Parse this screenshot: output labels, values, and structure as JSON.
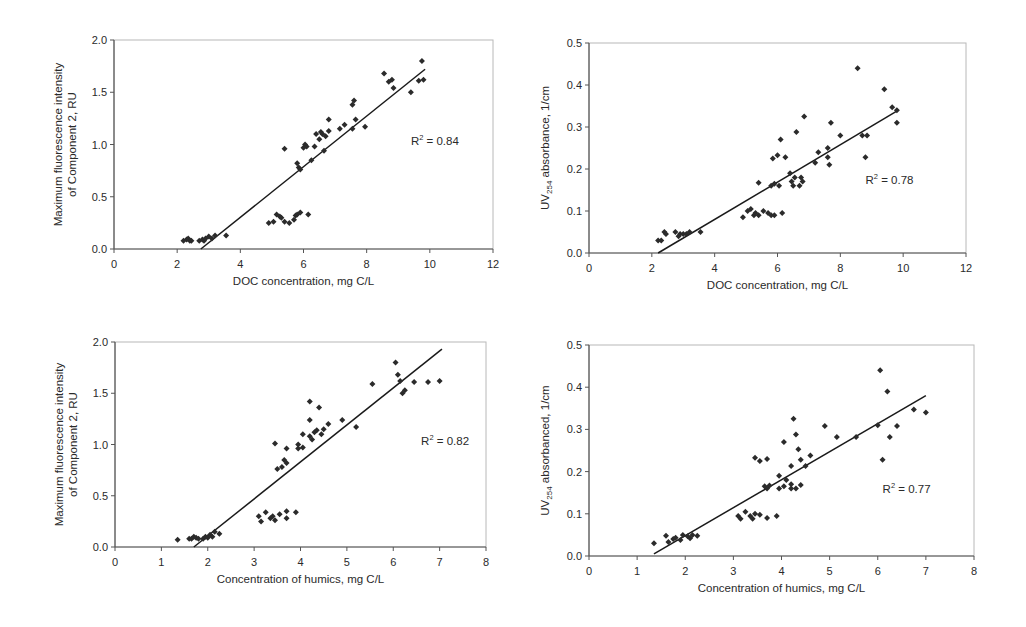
{
  "chart_data": [
    {
      "id": "c1",
      "type": "scatter",
      "title": "",
      "xlabel": "DOC concentration, mg C/L",
      "ylabel_lines": [
        "Maximum fluorescence intensity",
        "of Component 2, RU"
      ],
      "xlim": [
        0,
        12
      ],
      "ylim": [
        0,
        2.0
      ],
      "xticks": [
        0,
        2,
        4,
        6,
        8,
        10,
        12
      ],
      "yticks": [
        0.0,
        0.5,
        1.0,
        1.5,
        2.0
      ],
      "ytick_labels": [
        "0.0",
        "0.5",
        "1.0",
        "1.5",
        "2.0"
      ],
      "grid": false,
      "r2_label": "R",
      "r2_sup": "2",
      "r2_value": " = 0.84",
      "r2_pos": [
        9.4,
        1.0
      ],
      "trendline": {
        "x": [
          2.75,
          9.85
        ],
        "y": [
          0.0,
          1.72
        ]
      },
      "points": [
        [
          2.2,
          0.08
        ],
        [
          2.3,
          0.09
        ],
        [
          2.35,
          0.1
        ],
        [
          2.4,
          0.08
        ],
        [
          2.45,
          0.08
        ],
        [
          2.7,
          0.08
        ],
        [
          2.8,
          0.09
        ],
        [
          2.85,
          0.08
        ],
        [
          2.9,
          0.1
        ],
        [
          3.0,
          0.12
        ],
        [
          3.1,
          0.1
        ],
        [
          3.2,
          0.13
        ],
        [
          3.55,
          0.13
        ],
        [
          4.9,
          0.25
        ],
        [
          5.05,
          0.26
        ],
        [
          5.15,
          0.33
        ],
        [
          5.25,
          0.31
        ],
        [
          5.3,
          0.3
        ],
        [
          5.4,
          0.26
        ],
        [
          5.55,
          0.25
        ],
        [
          5.7,
          0.28
        ],
        [
          5.75,
          0.32
        ],
        [
          5.8,
          0.33
        ],
        [
          5.9,
          0.35
        ],
        [
          6.15,
          0.33
        ],
        [
          5.4,
          0.96
        ],
        [
          5.8,
          0.82
        ],
        [
          5.85,
          0.78
        ],
        [
          5.9,
          0.76
        ],
        [
          6.0,
          0.97
        ],
        [
          6.05,
          1.0
        ],
        [
          6.1,
          0.98
        ],
        [
          6.25,
          0.85
        ],
        [
          6.35,
          0.98
        ],
        [
          6.4,
          1.1
        ],
        [
          6.5,
          1.05
        ],
        [
          6.55,
          1.12
        ],
        [
          6.6,
          1.1
        ],
        [
          6.65,
          0.94
        ],
        [
          6.7,
          1.08
        ],
        [
          6.8,
          1.13
        ],
        [
          6.8,
          1.24
        ],
        [
          7.15,
          1.15
        ],
        [
          7.3,
          1.19
        ],
        [
          7.55,
          1.15
        ],
        [
          7.55,
          1.38
        ],
        [
          7.6,
          1.42
        ],
        [
          7.65,
          1.24
        ],
        [
          7.95,
          1.17
        ],
        [
          8.55,
          1.68
        ],
        [
          8.7,
          1.6
        ],
        [
          8.8,
          1.62
        ],
        [
          8.85,
          1.54
        ],
        [
          9.4,
          1.5
        ],
        [
          9.65,
          1.61
        ],
        [
          9.75,
          1.8
        ],
        [
          9.8,
          1.62
        ]
      ]
    },
    {
      "id": "c2",
      "type": "scatter",
      "title": "",
      "xlabel": "DOC concentration, mg C/L",
      "ylabel_prefix": "UV",
      "ylabel_sub": "254",
      "ylabel_suffix": " absorbance, 1/cm",
      "xlim": [
        0,
        12
      ],
      "ylim": [
        0,
        0.5
      ],
      "xticks": [
        0,
        2,
        4,
        6,
        8,
        10,
        12
      ],
      "yticks": [
        0.0,
        0.1,
        0.2,
        0.3,
        0.4,
        0.5
      ],
      "ytick_labels": [
        "0.0",
        "0.1",
        "0.2",
        "0.3",
        "0.4",
        "0.5"
      ],
      "grid": false,
      "r2_label": "R",
      "r2_sup": "2",
      "r2_value": " = 0.78",
      "r2_pos": [
        8.8,
        0.165
      ],
      "trendline": {
        "x": [
          2.2,
          9.85
        ],
        "y": [
          0.0,
          0.34
        ]
      },
      "points": [
        [
          2.2,
          0.03
        ],
        [
          2.3,
          0.03
        ],
        [
          2.4,
          0.05
        ],
        [
          2.45,
          0.045
        ],
        [
          2.75,
          0.05
        ],
        [
          2.85,
          0.04
        ],
        [
          2.9,
          0.045
        ],
        [
          3.0,
          0.045
        ],
        [
          3.1,
          0.045
        ],
        [
          3.2,
          0.05
        ],
        [
          3.55,
          0.05
        ],
        [
          4.9,
          0.085
        ],
        [
          5.05,
          0.1
        ],
        [
          5.15,
          0.105
        ],
        [
          5.25,
          0.09
        ],
        [
          5.3,
          0.095
        ],
        [
          5.4,
          0.09
        ],
        [
          5.55,
          0.1
        ],
        [
          5.7,
          0.095
        ],
        [
          5.8,
          0.09
        ],
        [
          5.9,
          0.09
        ],
        [
          6.15,
          0.095
        ],
        [
          5.4,
          0.167
        ],
        [
          5.8,
          0.16
        ],
        [
          5.85,
          0.225
        ],
        [
          5.9,
          0.165
        ],
        [
          6.0,
          0.233
        ],
        [
          6.05,
          0.16
        ],
        [
          6.1,
          0.27
        ],
        [
          6.25,
          0.228
        ],
        [
          6.4,
          0.19
        ],
        [
          6.45,
          0.17
        ],
        [
          6.5,
          0.16
        ],
        [
          6.55,
          0.18
        ],
        [
          6.6,
          0.288
        ],
        [
          6.7,
          0.16
        ],
        [
          6.75,
          0.18
        ],
        [
          6.8,
          0.17
        ],
        [
          6.85,
          0.325
        ],
        [
          7.2,
          0.215
        ],
        [
          7.3,
          0.24
        ],
        [
          7.6,
          0.25
        ],
        [
          7.6,
          0.228
        ],
        [
          7.65,
          0.21
        ],
        [
          7.7,
          0.31
        ],
        [
          8.0,
          0.28
        ],
        [
          8.55,
          0.44
        ],
        [
          8.7,
          0.28
        ],
        [
          8.8,
          0.228
        ],
        [
          8.85,
          0.28
        ],
        [
          9.4,
          0.39
        ],
        [
          9.65,
          0.347
        ],
        [
          9.8,
          0.31
        ],
        [
          9.8,
          0.34
        ]
      ]
    },
    {
      "id": "c3",
      "type": "scatter",
      "title": "",
      "xlabel": "Concentration of humics, mg C/L",
      "ylabel_lines": [
        "Maximum fluorescence intensity",
        "of Component 2, RU"
      ],
      "xlim": [
        0,
        8
      ],
      "ylim": [
        0,
        2.0
      ],
      "xticks": [
        0,
        1,
        2,
        3,
        4,
        5,
        6,
        7,
        8
      ],
      "yticks": [
        0.0,
        0.5,
        1.0,
        1.5,
        2.0
      ],
      "ytick_labels": [
        "0.0",
        "0.5",
        "1.0",
        "1.5",
        "2.0"
      ],
      "grid": false,
      "r2_label": "R",
      "r2_sup": "2",
      "r2_value": " = 0.82",
      "r2_pos": [
        6.6,
        1.0
      ],
      "trendline": {
        "x": [
          1.7,
          7.05
        ],
        "y": [
          0.0,
          1.93
        ]
      },
      "points": [
        [
          1.35,
          0.07
        ],
        [
          1.6,
          0.08
        ],
        [
          1.65,
          0.08
        ],
        [
          1.7,
          0.1
        ],
        [
          1.75,
          0.09
        ],
        [
          1.8,
          0.08
        ],
        [
          1.9,
          0.08
        ],
        [
          1.95,
          0.1
        ],
        [
          2.0,
          0.09
        ],
        [
          2.05,
          0.12
        ],
        [
          2.1,
          0.1
        ],
        [
          2.15,
          0.15
        ],
        [
          2.25,
          0.13
        ],
        [
          3.1,
          0.3
        ],
        [
          3.15,
          0.25
        ],
        [
          3.25,
          0.34
        ],
        [
          3.35,
          0.28
        ],
        [
          3.4,
          0.3
        ],
        [
          3.45,
          0.26
        ],
        [
          3.55,
          0.32
        ],
        [
          3.7,
          0.35
        ],
        [
          3.7,
          0.28
        ],
        [
          3.9,
          0.34
        ],
        [
          3.45,
          1.01
        ],
        [
          3.5,
          0.76
        ],
        [
          3.6,
          0.78
        ],
        [
          3.65,
          0.85
        ],
        [
          3.7,
          0.82
        ],
        [
          3.7,
          0.96
        ],
        [
          3.95,
          0.96
        ],
        [
          3.95,
          1.0
        ],
        [
          4.05,
          0.97
        ],
        [
          4.05,
          1.1
        ],
        [
          4.2,
          1.08
        ],
        [
          4.2,
          1.42
        ],
        [
          4.2,
          1.24
        ],
        [
          4.25,
          1.05
        ],
        [
          4.3,
          1.12
        ],
        [
          4.35,
          1.14
        ],
        [
          4.4,
          1.36
        ],
        [
          4.45,
          1.1
        ],
        [
          4.5,
          1.15
        ],
        [
          4.6,
          1.2
        ],
        [
          4.9,
          1.24
        ],
        [
          5.2,
          1.17
        ],
        [
          5.55,
          1.59
        ],
        [
          6.05,
          1.8
        ],
        [
          6.1,
          1.68
        ],
        [
          6.15,
          1.62
        ],
        [
          6.2,
          1.5
        ],
        [
          6.25,
          1.53
        ],
        [
          6.45,
          1.61
        ],
        [
          6.75,
          1.61
        ],
        [
          7.0,
          1.62
        ]
      ]
    },
    {
      "id": "c4",
      "type": "scatter",
      "title": "",
      "xlabel": "Concentration of humics, mg C/L",
      "ylabel_prefix": "UV",
      "ylabel_sub": "254",
      "ylabel_suffix": " absorbanced, 1/cm",
      "xlim": [
        0,
        8
      ],
      "ylim": [
        0,
        0.5
      ],
      "xticks": [
        0,
        1,
        2,
        3,
        4,
        5,
        6,
        7,
        8
      ],
      "yticks": [
        0.0,
        0.1,
        0.2,
        0.3,
        0.4,
        0.5
      ],
      "ytick_labels": [
        "0.0",
        "0.1",
        "0.2",
        "0.3",
        "0.4",
        "0.5"
      ],
      "grid": false,
      "r2_label": "R",
      "r2_sup": "2",
      "r2_value": " = 0.77",
      "r2_pos": [
        6.1,
        0.15
      ],
      "trendline": {
        "x": [
          1.35,
          7.0
        ],
        "y": [
          0.005,
          0.38
        ]
      },
      "points": [
        [
          1.35,
          0.03
        ],
        [
          1.6,
          0.048
        ],
        [
          1.65,
          0.033
        ],
        [
          1.75,
          0.04
        ],
        [
          1.8,
          0.043
        ],
        [
          1.9,
          0.038
        ],
        [
          1.95,
          0.05
        ],
        [
          2.05,
          0.047
        ],
        [
          2.1,
          0.042
        ],
        [
          2.15,
          0.05
        ],
        [
          2.25,
          0.048
        ],
        [
          3.1,
          0.095
        ],
        [
          3.15,
          0.088
        ],
        [
          3.25,
          0.105
        ],
        [
          3.35,
          0.095
        ],
        [
          3.4,
          0.088
        ],
        [
          3.45,
          0.1
        ],
        [
          3.55,
          0.098
        ],
        [
          3.7,
          0.09
        ],
        [
          3.9,
          0.095
        ],
        [
          3.45,
          0.233
        ],
        [
          3.55,
          0.225
        ],
        [
          3.7,
          0.23
        ],
        [
          3.65,
          0.165
        ],
        [
          3.7,
          0.16
        ],
        [
          3.75,
          0.167
        ],
        [
          3.95,
          0.19
        ],
        [
          3.95,
          0.16
        ],
        [
          4.05,
          0.165
        ],
        [
          4.05,
          0.27
        ],
        [
          4.1,
          0.18
        ],
        [
          4.2,
          0.16
        ],
        [
          4.2,
          0.213
        ],
        [
          4.2,
          0.17
        ],
        [
          4.25,
          0.325
        ],
        [
          4.3,
          0.16
        ],
        [
          4.3,
          0.288
        ],
        [
          4.35,
          0.253
        ],
        [
          4.4,
          0.168
        ],
        [
          4.4,
          0.228
        ],
        [
          4.5,
          0.213
        ],
        [
          4.6,
          0.238
        ],
        [
          4.9,
          0.308
        ],
        [
          5.15,
          0.282
        ],
        [
          5.55,
          0.282
        ],
        [
          6.0,
          0.31
        ],
        [
          6.05,
          0.44
        ],
        [
          6.1,
          0.228
        ],
        [
          6.2,
          0.39
        ],
        [
          6.25,
          0.282
        ],
        [
          6.4,
          0.308
        ],
        [
          6.75,
          0.347
        ],
        [
          7.0,
          0.34
        ]
      ]
    }
  ],
  "layout": {
    "plots": [
      {
        "left": 114,
        "top": 40,
        "right": 493,
        "bottom": 249
      },
      {
        "left": 589,
        "top": 43,
        "right": 966,
        "bottom": 253
      },
      {
        "left": 115,
        "top": 342,
        "right": 486,
        "bottom": 547
      },
      {
        "left": 589,
        "top": 345,
        "right": 974,
        "bottom": 556
      }
    ]
  },
  "colors": {
    "marker": "#2b2b2b",
    "axis": "#555555",
    "frame": "#b8b8b8",
    "trendline": "#1a1a1a",
    "text": "#2a2a2a"
  }
}
